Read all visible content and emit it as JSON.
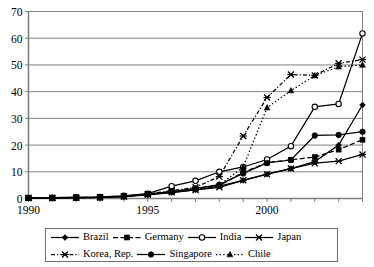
{
  "chart_data": {
    "type": "line",
    "title": "",
    "xlabel": "",
    "ylabel": "",
    "xlim": [
      1990,
      2004
    ],
    "ylim": [
      0,
      70
    ],
    "ytick_step": 10,
    "yticks": [
      0,
      10,
      20,
      30,
      40,
      50,
      60,
      70
    ],
    "xticks_labeled": [
      1990,
      1995,
      2000
    ],
    "x": [
      1990,
      1991,
      1992,
      1993,
      1994,
      1995,
      1996,
      1997,
      1998,
      1999,
      2000,
      2001,
      2002,
      2003,
      2004
    ],
    "grid": "horizontal",
    "legend_position": "bottom",
    "series": [
      {
        "name": "Brazil",
        "marker": "diamond",
        "line": "solid",
        "values": [
          0.2,
          0.2,
          0.3,
          0.4,
          0.7,
          1.4,
          2.2,
          3.2,
          4.6,
          6.8,
          9.1,
          11.2,
          13.8,
          20.0,
          35.0
        ]
      },
      {
        "name": "Germany",
        "marker": "square",
        "line": "dashed",
        "values": [
          0.2,
          0.2,
          0.3,
          0.4,
          0.8,
          1.6,
          2.5,
          3.6,
          4.8,
          9.8,
          13.4,
          14.5,
          15.5,
          18.3,
          22.0
        ]
      },
      {
        "name": "India",
        "marker": "circle-open",
        "line": "solid",
        "values": [
          0.2,
          0.3,
          0.5,
          0.6,
          1.0,
          1.8,
          4.6,
          6.6,
          10.0,
          11.8,
          14.6,
          19.6,
          34.3,
          35.4,
          61.8
        ]
      },
      {
        "name": "Japan",
        "marker": "x",
        "line": "solid",
        "values": [
          0.2,
          0.2,
          0.3,
          0.4,
          0.7,
          1.5,
          2.3,
          3.2,
          4.2,
          6.8,
          9.1,
          11.2,
          13.2,
          14.0,
          16.5
        ]
      },
      {
        "name": "Korea, Rep.",
        "marker": "x",
        "line": "dash-dot",
        "values": [
          0.2,
          0.2,
          0.3,
          0.5,
          0.9,
          1.7,
          2.9,
          4.2,
          8.2,
          23.4,
          37.8,
          46.4,
          46.1,
          50.6,
          52.0
        ]
      },
      {
        "name": "Singapore",
        "marker": "circle-filled",
        "line": "solid",
        "values": [
          0.2,
          0.2,
          0.3,
          0.4,
          0.8,
          1.6,
          2.6,
          3.8,
          5.2,
          9.4,
          13.3,
          14.4,
          23.6,
          23.8,
          25.0
        ]
      },
      {
        "name": "Chile",
        "marker": "triangle",
        "line": "dotted",
        "values": [
          0.2,
          0.2,
          0.3,
          0.4,
          0.8,
          1.5,
          2.6,
          3.6,
          5.0,
          11.8,
          34.0,
          40.4,
          46.0,
          49.3,
          50.0
        ]
      }
    ]
  },
  "legend": {
    "rows": [
      [
        "Brazil",
        "Germany",
        "India",
        "Japan"
      ],
      [
        "Korea, Rep.",
        "Singapore",
        "Chile"
      ]
    ]
  },
  "colors": {
    "line": "#000000",
    "grid": "#808080",
    "axis": "#808080",
    "background": "#ffffff",
    "legend_border": "#6f6f6f"
  }
}
